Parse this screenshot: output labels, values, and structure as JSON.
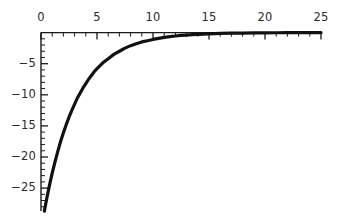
{
  "chart_data": {
    "type": "line",
    "title": "",
    "subtitle": "",
    "xlabel": "",
    "ylabel": "",
    "xlim": [
      0,
      25
    ],
    "ylim": [
      -28.7,
      0
    ],
    "grid": false,
    "legend": null,
    "annotations": [],
    "axis": {
      "x_axis_position": "top",
      "y_axis_position": "left",
      "x_major_ticks": [
        0,
        5,
        10,
        15,
        20,
        25
      ],
      "x_minor_tick_step": 1,
      "y_major_ticks": [
        -5,
        -10,
        -15,
        -20,
        -25
      ],
      "y_minor_tick_step": 1,
      "x_tick_labels": [
        "0",
        "5",
        "10",
        "15",
        "20",
        "25"
      ],
      "y_tick_labels": [
        "−5",
        "−10",
        "−15",
        "−20",
        "−25"
      ],
      "tick_direction": "inward",
      "axis_color": "#1a1a1a",
      "axis_width": 1.4
    },
    "series": [
      {
        "name": "exponential-decay",
        "color": "#111111",
        "line_width": 3.2,
        "x": [
          0.3,
          0.5,
          0.75,
          1,
          1.25,
          1.5,
          1.75,
          2,
          2.25,
          2.5,
          2.75,
          3,
          3.25,
          3.5,
          3.75,
          4,
          4.25,
          4.5,
          4.75,
          5,
          5.5,
          6,
          6.5,
          7,
          7.5,
          8,
          8.5,
          9,
          9.5,
          10,
          10.5,
          11,
          11.5,
          12,
          12.5,
          13,
          13.5,
          14,
          14.5,
          15,
          16,
          17,
          18,
          19,
          20,
          21,
          22,
          23,
          24,
          25
        ],
        "y": [
          -28.7,
          -26.8,
          -24.6,
          -22.6,
          -20.8,
          -19.1,
          -17.5,
          -16.1,
          -14.8,
          -13.6,
          -12.5,
          -11.5,
          -10.5,
          -9.7,
          -8.9,
          -8.2,
          -7.5,
          -6.9,
          -6.3,
          -5.8,
          -4.9,
          -4.2,
          -3.5,
          -3.0,
          -2.5,
          -2.1,
          -1.8,
          -1.5,
          -1.3,
          -1.1,
          -0.92,
          -0.77,
          -0.65,
          -0.55,
          -0.46,
          -0.39,
          -0.33,
          -0.27,
          -0.23,
          -0.19,
          -0.14,
          -0.1,
          -0.07,
          -0.05,
          -0.035,
          -0.025,
          -0.018,
          -0.013,
          -0.009,
          -0.006
        ]
      }
    ]
  },
  "colors": {
    "background": "#ffffff",
    "axis": "#1a1a1a",
    "curve": "#111111",
    "label": "#2b2b2b"
  }
}
